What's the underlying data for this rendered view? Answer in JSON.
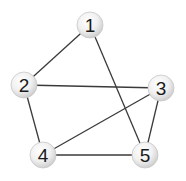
{
  "diagram": {
    "type": "undirected-graph",
    "nodes": [
      {
        "id": "1",
        "label": "1",
        "x": 90,
        "y": 25
      },
      {
        "id": "2",
        "label": "2",
        "x": 24,
        "y": 85
      },
      {
        "id": "3",
        "label": "3",
        "x": 161,
        "y": 88
      },
      {
        "id": "4",
        "label": "4",
        "x": 43,
        "y": 155
      },
      {
        "id": "5",
        "label": "5",
        "x": 145,
        "y": 155
      }
    ],
    "edges": [
      {
        "from": "1",
        "to": "2"
      },
      {
        "from": "1",
        "to": "5"
      },
      {
        "from": "2",
        "to": "3"
      },
      {
        "from": "2",
        "to": "4"
      },
      {
        "from": "3",
        "to": "4"
      },
      {
        "from": "3",
        "to": "5"
      },
      {
        "from": "4",
        "to": "5"
      }
    ],
    "colors": {
      "edge": "#3a3a3a",
      "node_fill_light": "#ffffff",
      "node_fill_dark": "#d4d4d4",
      "node_stroke": "#c8c8c8",
      "label": "#1a1a1a"
    }
  }
}
